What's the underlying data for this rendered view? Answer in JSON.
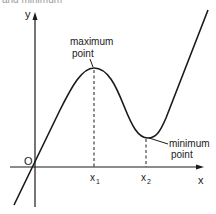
{
  "diagram": {
    "type": "function-graph",
    "caption_fragment": "and minimum",
    "axes": {
      "x_label": "x",
      "y_label": "y",
      "origin_label": "O"
    },
    "ticks": [
      {
        "base": "x",
        "sub": "1"
      },
      {
        "base": "x",
        "sub": "2"
      }
    ],
    "annotations": {
      "maximum": {
        "line1": "maximum",
        "line2": "point"
      },
      "minimum": {
        "line1": "minimum",
        "line2": "point"
      }
    },
    "colors": {
      "ink": "#1a1a1a",
      "background": "#ffffff"
    }
  }
}
